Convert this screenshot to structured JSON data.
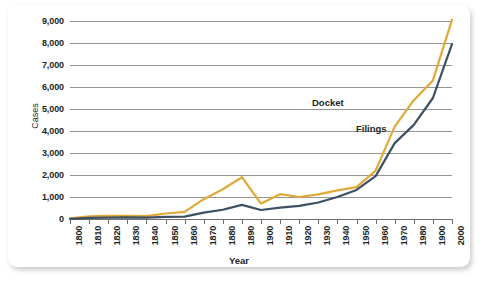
{
  "chart_data": {
    "type": "line",
    "title": "",
    "xlabel": "Year",
    "ylabel": "Cases",
    "xlim": [
      1800,
      2000
    ],
    "ylim": [
      0,
      9000
    ],
    "grid": true,
    "legend_position": "inline-annotation",
    "y_ticks": [
      0,
      1000,
      2000,
      3000,
      4000,
      5000,
      6000,
      7000,
      8000,
      9000
    ],
    "y_tick_labels": [
      "0",
      "1,000",
      "2,000",
      "3,000",
      "4,000",
      "5,000",
      "6,000",
      "7,000",
      "8,000",
      "9,000"
    ],
    "x_ticks": [
      1800,
      1810,
      1820,
      1830,
      1840,
      1850,
      1860,
      1870,
      1880,
      1890,
      1900,
      1910,
      1920,
      1930,
      1940,
      1950,
      1960,
      1970,
      1980,
      1990,
      2000
    ],
    "x_tick_labels": [
      "1800",
      "1810",
      "1820",
      "1830",
      "1840",
      "1850",
      "1860",
      "1870",
      "1880",
      "1890",
      "1900",
      "1910",
      "1920",
      "1930",
      "1940",
      "1950",
      "1960",
      "1970",
      "1980",
      "1900",
      "2000"
    ],
    "x": [
      1800,
      1810,
      1820,
      1830,
      1840,
      1850,
      1860,
      1870,
      1880,
      1890,
      1900,
      1910,
      1920,
      1930,
      1940,
      1950,
      1960,
      1970,
      1980,
      1990,
      2000
    ],
    "series": [
      {
        "name": "Docket",
        "color": "#E0A937",
        "values": [
          30,
          120,
          140,
          140,
          130,
          250,
          320,
          900,
          1350,
          1900,
          700,
          1130,
          1000,
          1120,
          1300,
          1450,
          2200,
          4200,
          5400,
          6300,
          9050
        ]
      },
      {
        "name": "Filings",
        "color": "#3C4F63",
        "values": [
          10,
          50,
          60,
          70,
          60,
          100,
          110,
          290,
          420,
          640,
          410,
          520,
          600,
          750,
          1000,
          1320,
          1950,
          3450,
          4280,
          5500,
          7950
        ]
      }
    ],
    "annotations": [
      {
        "text": "Docket",
        "series": "Docket"
      },
      {
        "text": "Filings",
        "series": "Filings"
      }
    ]
  },
  "style": {
    "docket_color": "#E0A937",
    "filings_color": "#3C4F63",
    "gridline_color": "#949494",
    "axis_color": "#6E6E6E",
    "card_background": "#FFFFFF",
    "text_color": "#221F1F"
  }
}
